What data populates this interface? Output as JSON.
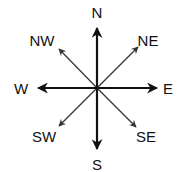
{
  "diagram": {
    "colors": {
      "main_arrow": "#111111",
      "diagonal_arrow": "#333333",
      "label": "#111111"
    },
    "directions": [
      {
        "id": "n",
        "label": "N",
        "type": "cardinal"
      },
      {
        "id": "ne",
        "label": "NE",
        "type": "intercardinal"
      },
      {
        "id": "e",
        "label": "E",
        "type": "cardinal"
      },
      {
        "id": "se",
        "label": "SE",
        "type": "intercardinal"
      },
      {
        "id": "s",
        "label": "S",
        "type": "cardinal"
      },
      {
        "id": "sw",
        "label": "SW",
        "type": "intercardinal"
      },
      {
        "id": "w",
        "label": "W",
        "type": "cardinal"
      },
      {
        "id": "nw",
        "label": "NW",
        "type": "intercardinal"
      }
    ]
  }
}
